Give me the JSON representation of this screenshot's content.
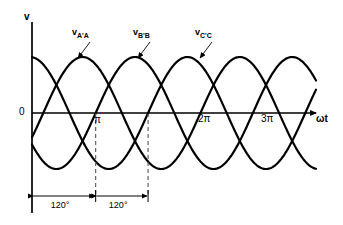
{
  "figure": {
    "kind": "three-phase-voltage-waveform-diagram",
    "background_color": "#ffffff",
    "line_color": "#000000",
    "dashed_color": "#555555"
  },
  "axes": {
    "y_axis_label": "v",
    "x_axis_label": "ωt",
    "origin_label": "0",
    "x_ticks": [
      {
        "label": "π",
        "value": 3.14159
      },
      {
        "label": "2π",
        "value": 6.28319
      },
      {
        "label": "3π",
        "value": 9.42478
      }
    ],
    "x_range": [
      -0.45,
      10.9
    ],
    "y_range": [
      -1.35,
      1.85
    ],
    "grid": false
  },
  "curves": [
    {
      "name": "v-a-prime-a",
      "label_v": "v",
      "label_sub": "A'A",
      "phase_deg": 0
    },
    {
      "name": "v-b-prime-b",
      "label_v": "v",
      "label_sub": "B'B",
      "phase_deg": -120
    },
    {
      "name": "v-c-prime-c",
      "label_v": "v",
      "label_sub": "C'C",
      "phase_deg": -240
    }
  ],
  "annotations": {
    "dimensions": [
      {
        "label": "120°"
      },
      {
        "label": "120°"
      }
    ],
    "dashed_lines": 2
  },
  "chart_data": {
    "type": "line",
    "title": "",
    "xlabel": "ωt",
    "ylabel": "v",
    "xlim": [
      -0.45,
      10.9
    ],
    "ylim": [
      -1.35,
      1.85
    ],
    "grid": false,
    "legend_position": "inline-leader-labels",
    "xtick_values": [
      3.14159,
      6.28319,
      9.42478
    ],
    "xtick_labels": [
      "π",
      "2π",
      "3π"
    ],
    "ytick_values": [
      0
    ],
    "ytick_labels": [
      "0"
    ],
    "annotations": [
      "120°",
      "120°"
    ],
    "series": [
      {
        "name": "v_A'A",
        "amplitude": 1,
        "phase_deg": 0,
        "function": "sin(wt)"
      },
      {
        "name": "v_B'B",
        "amplitude": 1,
        "phase_deg": -120,
        "function": "sin(wt - 120°)"
      },
      {
        "name": "v_C'C",
        "amplitude": 1,
        "phase_deg": -240,
        "function": "sin(wt - 240°)"
      }
    ]
  }
}
